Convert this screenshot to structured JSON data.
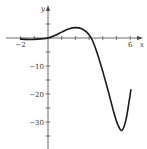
{
  "chart_data": {
    "type": "line",
    "title": "",
    "xlabel": "x",
    "ylabel": "y",
    "xlim": [
      -2.5,
      7
    ],
    "ylim": [
      -38,
      10
    ],
    "x_ticks": [
      -2,
      -1,
      1,
      2,
      3,
      4,
      5,
      6
    ],
    "x_tick_labels": [
      {
        "value": -2,
        "label": "−2"
      },
      {
        "value": 6,
        "label": "6"
      }
    ],
    "y_ticks": [
      5,
      -5,
      -10,
      -15,
      -20,
      -25,
      -30,
      -35
    ],
    "y_tick_labels": [
      {
        "value": -10,
        "label": "−10"
      },
      {
        "value": -20,
        "label": "−20"
      },
      {
        "value": -30,
        "label": "−30"
      }
    ],
    "grid": false,
    "legend": null,
    "series": [
      {
        "name": "f(x)",
        "color": "#1a1a1a",
        "x": [
          -2,
          -1.5,
          -1,
          -0.5,
          0,
          0.5,
          1,
          1.5,
          2,
          2.5,
          3,
          3.3,
          3.6,
          4,
          4.4,
          4.8,
          5.1,
          5.4,
          5.7,
          6.05
        ],
        "y": [
          -0.4,
          -0.5,
          -0.5,
          -0.3,
          0,
          0.9,
          2.1,
          3.2,
          3.7,
          3.2,
          1.2,
          -1.5,
          -5.5,
          -12,
          -19,
          -26.5,
          -31,
          -33,
          -29,
          -18.5
        ]
      }
    ]
  }
}
